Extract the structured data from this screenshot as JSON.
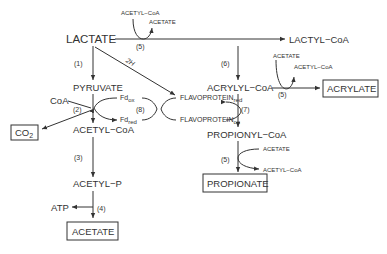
{
  "diagram": {
    "nodes": {
      "lactate": "LACTATE",
      "lactyl_coa": "LACTYL−CoA",
      "pyruvate": "PYRUVATE",
      "acryl_coa": "ACRYLYL−CoA",
      "acrylate": "ACRYLATE",
      "acetyl_coa": "ACETYL−CoA",
      "propionyl_coa": "PROPIONYL−CoA",
      "acetyl_p": "ACETYL−P",
      "propionate": "PROPIONATE",
      "acetate": "ACETATE",
      "co2": "CO",
      "co2_sub": "2",
      "coa": "CoA",
      "atp": "ATP",
      "fd_ox": "Fd",
      "fd_ox_sub": "ox",
      "fd_red": "Fd",
      "fd_red_sub": "red",
      "flavo_red": "FLAVOPROTEIN",
      "flavo_red_sub": "red",
      "flavo_ox": "FLAVOPROTEIN",
      "flavo_ox_sub": "ox"
    },
    "cosubstrates": {
      "top_acetyl_coa": "ACETYL−CoA",
      "top_acetate": "ACETATE",
      "acr_acetate": "ACETATE",
      "acr_acetyl_coa": "ACETYL−CoA",
      "prop_acetate": "ACETATE",
      "prop_acetyl_coa": "ACETYL−CoA"
    },
    "steps": {
      "s1": "(1)",
      "s2": "(2)",
      "s3": "(3)",
      "s4": "(4)",
      "s5_top": "(5)",
      "s5_acr": "(5)",
      "s5_prop": "(5)",
      "s6": "(6)",
      "s7": "(7)",
      "s8": "(8)",
      "two_h": "2H"
    }
  }
}
